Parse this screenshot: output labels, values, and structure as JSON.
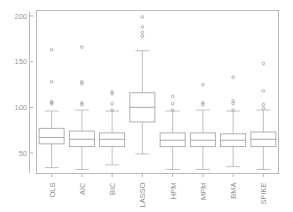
{
  "chart_data": {
    "type": "box",
    "title": "",
    "xlabel": "",
    "ylabel": "",
    "ylim": [
      28,
      205
    ],
    "yticks": [
      50,
      100,
      150,
      200
    ],
    "ytick_labels": [
      "50",
      "100",
      "150",
      "200"
    ],
    "grid": false,
    "legend": "none",
    "categories": [
      "OLS",
      "AIC",
      "BIC",
      "LASSO",
      "HPM",
      "MPM",
      "BMA",
      "SPIKE"
    ],
    "series": [
      {
        "name": "OLS",
        "whisker_low": 34,
        "q1": 60,
        "median": 67,
        "q3": 77,
        "whisker_high": 96,
        "outliers": [
          104,
          105,
          106,
          128,
          163
        ]
      },
      {
        "name": "AIC",
        "whisker_low": 32,
        "q1": 57,
        "median": 65,
        "q3": 74,
        "whisker_high": 97,
        "outliers": [
          103,
          105,
          126,
          128,
          166
        ]
      },
      {
        "name": "BIC",
        "whisker_low": 37,
        "q1": 57,
        "median": 65,
        "q3": 72,
        "whisker_high": 96,
        "outliers": [
          97,
          104,
          115,
          117
        ]
      },
      {
        "name": "LASSO",
        "whisker_low": 49,
        "q1": 84,
        "median": 100,
        "q3": 116,
        "whisker_high": 162,
        "outliers": [
          178,
          182,
          188,
          199
        ]
      },
      {
        "name": "HPM",
        "whisker_low": 32,
        "q1": 57,
        "median": 64,
        "q3": 72,
        "whisker_high": 96,
        "outliers": [
          97,
          104,
          112
        ]
      },
      {
        "name": "MPM",
        "whisker_low": 32,
        "q1": 57,
        "median": 64,
        "q3": 72,
        "whisker_high": 97,
        "outliers": [
          103,
          105,
          125
        ]
      },
      {
        "name": "BMA",
        "whisker_low": 35,
        "q1": 57,
        "median": 64,
        "q3": 71,
        "whisker_high": 96,
        "outliers": [
          97,
          104,
          107,
          133
        ]
      },
      {
        "name": "SPIKE",
        "whisker_low": 32,
        "q1": 57,
        "median": 65,
        "q3": 73,
        "whisker_high": 97,
        "outliers": [
          99,
          103,
          118,
          148
        ]
      }
    ]
  },
  "style": {
    "frame_color": "#b9b9b9",
    "box_color": "#a8a8a8",
    "text_color": "#929292",
    "background": "#ffffff"
  }
}
